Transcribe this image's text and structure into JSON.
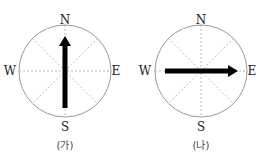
{
  "panels": [
    {
      "caption": "(가)",
      "directions": {
        "north": "N",
        "south": "S",
        "east": "E",
        "west": "W"
      },
      "arrow_direction": "north",
      "arrow_desc": "arrow from south toward north"
    },
    {
      "caption": "(나)",
      "directions": {
        "north": "N",
        "south": "S",
        "east": "E",
        "west": "W"
      },
      "arrow_direction": "east",
      "arrow_desc": "arrow from west toward east"
    }
  ],
  "colors": {
    "circle": "#999999",
    "dashed": "#aaaaaa",
    "arrow": "#000000"
  }
}
